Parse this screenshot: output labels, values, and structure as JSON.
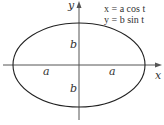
{
  "diagram": {
    "type": "parametric-ellipse",
    "equations": {
      "line1": "x = a cos t",
      "line2": "y = b sin t"
    },
    "axes": {
      "x_label": "x",
      "y_label": "y"
    },
    "labels": {
      "semi_major_left": "a",
      "semi_major_right": "a",
      "semi_minor_top": "b",
      "semi_minor_bottom": "b"
    },
    "colors": {
      "curve": "#222222",
      "axes": "#555555",
      "text": "#333333"
    }
  }
}
